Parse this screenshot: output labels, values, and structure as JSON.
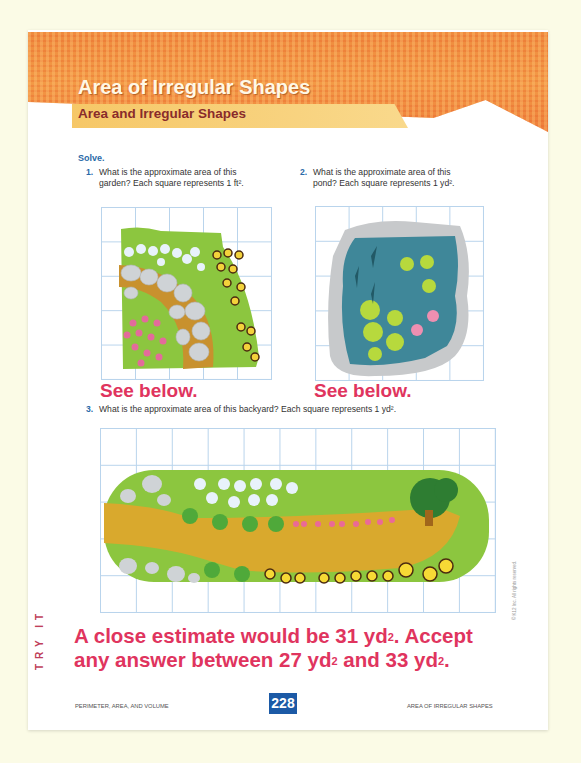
{
  "header": {
    "title": "Area of Irregular Shapes",
    "subtitle": "Area and Irregular Shapes"
  },
  "instructions": "Solve.",
  "problems": [
    {
      "number": "1.",
      "line1": "What is the approximate area of this",
      "line2": "garden? Each square represents 1 ft².",
      "figure": "garden-on-grid",
      "grid": {
        "columns": 5,
        "rows": 5
      },
      "answer": "See below."
    },
    {
      "number": "2.",
      "line1": "What is the approximate area of this",
      "line2": "pond? Each square represents 1 yd².",
      "figure": "pond-on-grid",
      "grid": {
        "columns": 5,
        "rows": 5
      },
      "answer": "See below."
    },
    {
      "number": "3.",
      "line1": "What is the approximate area of this backyard? Each square represents 1 yd².",
      "figure": "backyard-on-grid",
      "grid": {
        "columns": 11,
        "rows": 5
      },
      "answer": {
        "part1": "A close estimate would be 31 yd",
        "part2": ". Accept",
        "part3": "any answer between 27 yd",
        "part4": " and 33 yd",
        "part5": ".",
        "sup": "2"
      }
    }
  ],
  "side_tab": "TRY IT",
  "footer": {
    "left": "PERIMETER, AREA, AND VOLUME",
    "page_number": "228",
    "right": "AREA OF IRREGULAR SHAPES"
  },
  "copyright": "© K12 Inc. All rights reserved.",
  "colors": {
    "banner_orange": "#ef8a3e",
    "subtitle_bar": "#f6c767",
    "answer_pink": "#e0345e",
    "accent_blue": "#2a6aa8",
    "page_number_bg": "#1c5aa6",
    "grid_line": "#b9d4ec"
  }
}
